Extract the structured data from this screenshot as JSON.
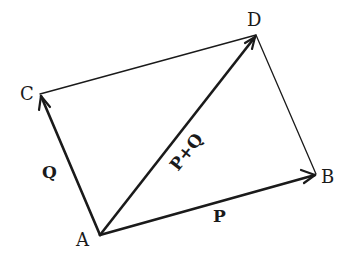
{
  "diagram": {
    "type": "vector-parallelogram",
    "points": {
      "A": {
        "label": "A",
        "x": 100,
        "y": 235
      },
      "B": {
        "label": "B",
        "x": 316,
        "y": 174
      },
      "C": {
        "label": "C",
        "x": 40,
        "y": 94
      },
      "D": {
        "label": "D",
        "x": 256,
        "y": 35
      }
    },
    "vectors": [
      {
        "name": "P",
        "label": "P",
        "from": "A",
        "to": "B",
        "weight": "thick",
        "arrow": true
      },
      {
        "name": "Q",
        "label": "Q",
        "from": "A",
        "to": "C",
        "weight": "thick",
        "arrow": true
      },
      {
        "name": "P+Q",
        "label": "P+Q",
        "from": "A",
        "to": "D",
        "weight": "thick",
        "arrow": true
      }
    ],
    "edges": [
      {
        "from": "C",
        "to": "D",
        "weight": "thin"
      },
      {
        "from": "D",
        "to": "B",
        "weight": "thin"
      }
    ],
    "colors": {
      "ink": "#1a1a1a",
      "background": "#ffffff"
    }
  }
}
